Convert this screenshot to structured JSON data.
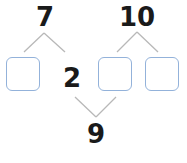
{
  "diagram": {
    "type": "number-bond-puzzle",
    "top_numbers": [
      {
        "id": "left_top",
        "value": "7"
      },
      {
        "id": "right_top",
        "value": "10"
      }
    ],
    "middle_number": {
      "value": "2"
    },
    "bottom_number": {
      "value": "9"
    },
    "answer_boxes": [
      {
        "id": "box_1",
        "value": ""
      },
      {
        "id": "box_2",
        "value": ""
      },
      {
        "id": "box_3",
        "value": ""
      }
    ],
    "colors": {
      "box_border": "#93b2da",
      "line": "#b5b5b5",
      "number": "#1a1a1a"
    }
  }
}
